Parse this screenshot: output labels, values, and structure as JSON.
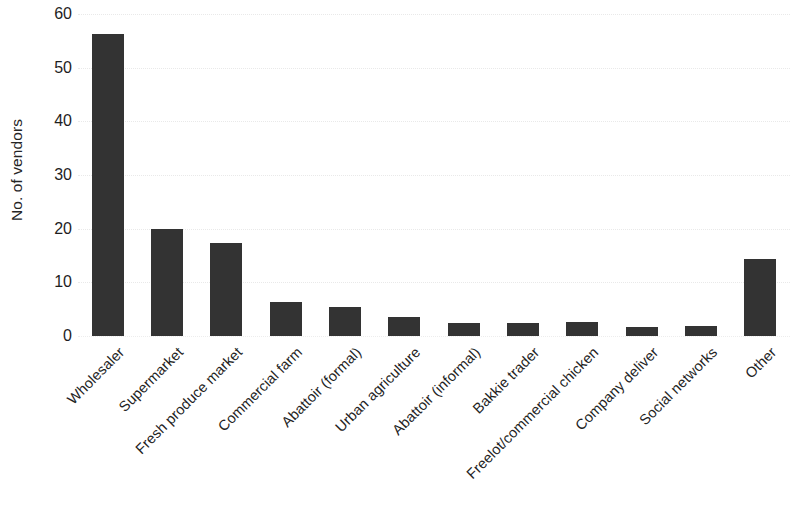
{
  "chart_data": {
    "type": "bar",
    "title": "",
    "subtitle": "",
    "xlabel": "",
    "ylabel": "No. of vendors",
    "ylim": [
      0,
      60
    ],
    "yticks": [
      0,
      10,
      20,
      30,
      40,
      50,
      60
    ],
    "ytick_labels": [
      "0",
      "10",
      "20",
      "30",
      "40",
      "50",
      "60"
    ],
    "grid": true,
    "grid_axis": "y",
    "legend": false,
    "legend_position": "none",
    "bar_color": "#333333",
    "background_color": "#ffffff",
    "x_label_rotation": -45,
    "categories": [
      "Wholesaler",
      "Supermarket",
      "Fresh produce market",
      "Commercial farm",
      "Abattoir (formal)",
      "Urban agriculture",
      "Abattoir (informal)",
      "Bakkie trader",
      "Freelot/commercial chicken",
      "Company deliver",
      "Social networks",
      "Other"
    ],
    "values": [
      56.2,
      20.0,
      17.3,
      6.3,
      5.4,
      3.6,
      2.5,
      2.5,
      2.6,
      1.7,
      1.8,
      14.3
    ]
  }
}
